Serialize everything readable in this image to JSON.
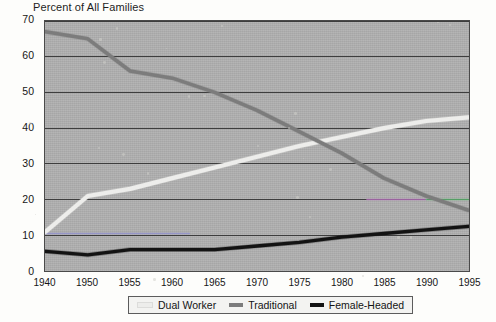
{
  "chart_data": {
    "type": "line",
    "title": "Percent of All Families",
    "xlabel": "",
    "ylabel": "Percent of All Families",
    "xlim": [
      1940,
      1995
    ],
    "ylim": [
      0,
      70
    ],
    "grid": true,
    "legend_position": "bottom",
    "x": [
      1940,
      1950,
      1955,
      1960,
      1965,
      1970,
      1975,
      1980,
      1985,
      1990,
      1995
    ],
    "xticklabels": [
      "1940",
      "1950",
      "1955",
      "1960",
      "1965",
      "1970",
      "1975",
      "1980",
      "1985",
      "1990",
      "1995"
    ],
    "yticklabels": [
      "0",
      "10",
      "20",
      "30",
      "40",
      "50",
      "60",
      "70"
    ],
    "yticks": [
      0,
      10,
      20,
      30,
      40,
      50,
      60,
      70
    ],
    "series": [
      {
        "name": "Dual Worker",
        "color": "#ededeb",
        "values": [
          11,
          21,
          23,
          26,
          29,
          32,
          35,
          37.5,
          40,
          42,
          43
        ]
      },
      {
        "name": "Traditional",
        "color": "#7c7c7c",
        "values": [
          67,
          65,
          56,
          54,
          50,
          45,
          39,
          33,
          26,
          21,
          17
        ]
      },
      {
        "name": "Female-Headed",
        "color": "#131313",
        "values": [
          5.5,
          4.5,
          6,
          6,
          6,
          7,
          8,
          9.5,
          10.5,
          11.5,
          12.5
        ]
      }
    ],
    "artifacts": [
      {
        "name": "magenta-gridline-tint",
        "color": "#b96fc0",
        "y": 20,
        "x_start": 1983,
        "x_end": 1990
      },
      {
        "name": "green-gridline-tint",
        "color": "#5cbf72",
        "y": 20,
        "x_start": 1990,
        "x_end": 1995
      },
      {
        "name": "blue-gridline-tint",
        "color": "#8f8fd0",
        "y": 10.5,
        "x_start": 1940,
        "x_end": 1962
      }
    ],
    "plot_background": "#b0b0b0",
    "gridline_color": "#3c3c3c"
  },
  "legend": {
    "items": [
      {
        "label": "Dual Worker",
        "color": "#ededeb"
      },
      {
        "label": "Traditional",
        "color": "#7c7c7c"
      },
      {
        "label": "Female-Headed",
        "color": "#131313"
      }
    ]
  }
}
